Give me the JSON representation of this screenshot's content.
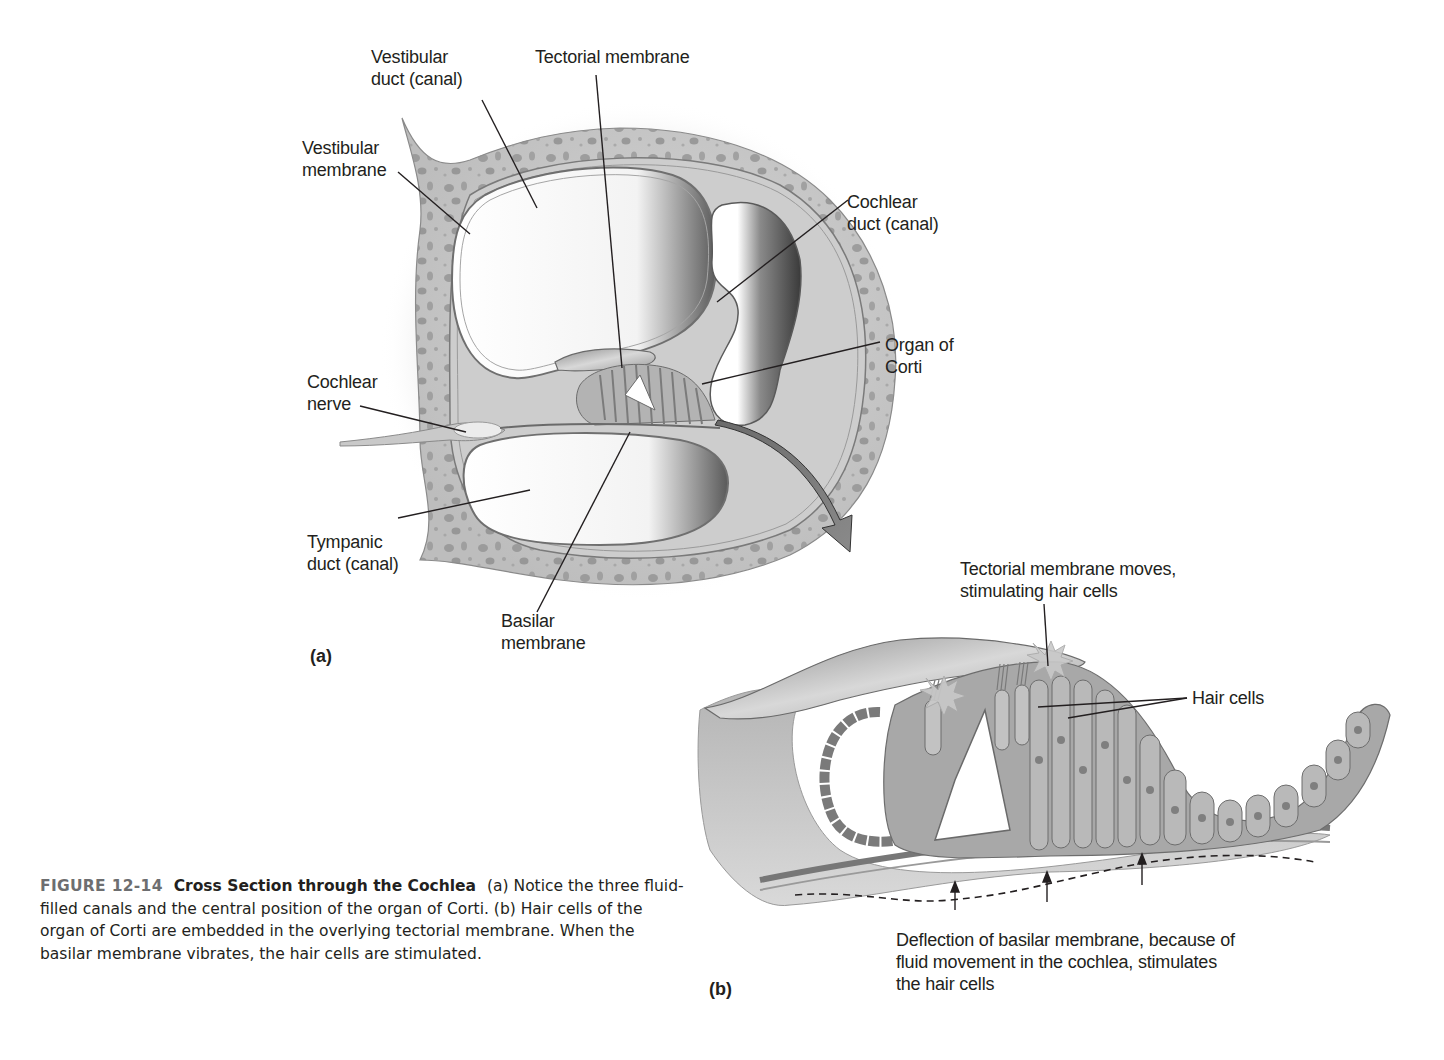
{
  "figure": {
    "number": "FIGURE 12-14",
    "title": "Cross Section through the Cochlea",
    "caption": "(a) Notice the three fluid-filled canals and the central position of the organ of Corti. (b) Hair cells of the organ of Corti are embedded in the overlying tectorial membrane. When the basilar membrane vibrates, the hair cells are stimulated."
  },
  "panel_a": {
    "letter": "(a)",
    "labels": {
      "vestibular_duct": "Vestibular\nduct (canal)",
      "tectorial_membrane": "Tectorial membrane",
      "vestibular_membrane": "Vestibular\nmembrane",
      "cochlear_duct": "Cochlear\nduct (canal)",
      "organ_of_corti": "Organ of\nCorti",
      "cochlear_nerve": "Cochlear\nnerve",
      "tympanic_duct": "Tympanic\nduct (canal)",
      "basilar_membrane": "Basilar\nmembrane"
    }
  },
  "panel_b": {
    "letter": "(b)",
    "labels": {
      "tectorial_moves": "Tectorial membrane moves,\nstimulating hair cells",
      "hair_cells": "Hair cells",
      "deflection": "Deflection of basilar membrane, because of\nfluid movement in the cochlea, stimulates\nthe hair cells"
    }
  },
  "colors": {
    "bone": "#c9c9c9",
    "bone_pore": "#8a8a8a",
    "membrane": "#9a9a9a",
    "shadow": "#4a4a4a",
    "text": "#231f20",
    "figure_number": "#6d6e70"
  }
}
